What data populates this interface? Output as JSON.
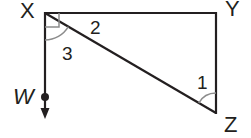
{
  "diagram": {
    "points": {
      "X": {
        "label": "X",
        "x": 45,
        "y": 13
      },
      "Y": {
        "label": "Y",
        "x": 216,
        "y": 13
      },
      "Z": {
        "label": "Z",
        "x": 216,
        "y": 113
      },
      "W": {
        "label": "W",
        "x": 45,
        "y": 97
      }
    },
    "angles": {
      "angle1": {
        "label": "1"
      },
      "angle2": {
        "label": "2"
      },
      "angle3": {
        "label": "3"
      }
    },
    "colors": {
      "line": "#231f20",
      "arc": "#8c8c8c"
    }
  }
}
